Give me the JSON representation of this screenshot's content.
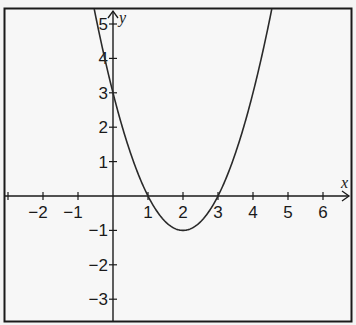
{
  "chart_data": {
    "type": "line",
    "title": "",
    "xlabel": "x",
    "ylabel": "y",
    "function": "y = x^2 - 4x + 3 = (x - 1)(x - 3)",
    "xlim": [
      -3.1,
      6.9
    ],
    "ylim": [
      -3.6,
      5.4
    ],
    "x_ticks": [
      -2,
      -1,
      1,
      2,
      3,
      4,
      5,
      6
    ],
    "x_tick_labels": [
      "−2",
      "−1",
      "1",
      "2",
      "3",
      "4",
      "5",
      "6"
    ],
    "y_ticks": [
      5,
      4,
      3,
      2,
      1,
      -1,
      -2,
      -3
    ],
    "y_tick_labels": [
      "5",
      "4",
      "3",
      "2",
      "1",
      "−1",
      "−2",
      "−3"
    ],
    "grid": false,
    "legend": null,
    "series": [
      {
        "name": "parabola",
        "x": [
          -0.6,
          0,
          0.5,
          1,
          1.5,
          2,
          2.5,
          3,
          3.5,
          4,
          4.5
        ],
        "y": [
          5.76,
          3,
          1.25,
          0,
          -0.75,
          -1,
          -0.75,
          0,
          1.25,
          3,
          5.25
        ]
      }
    ],
    "annotations": {
      "vertex": [
        2,
        -1
      ],
      "x_intercepts": [
        1,
        3
      ],
      "y_intercept": 3
    }
  },
  "colors": {
    "background": "#f4f4f4",
    "ink": "#1a1a1a",
    "curve": "#2a2a2a"
  }
}
